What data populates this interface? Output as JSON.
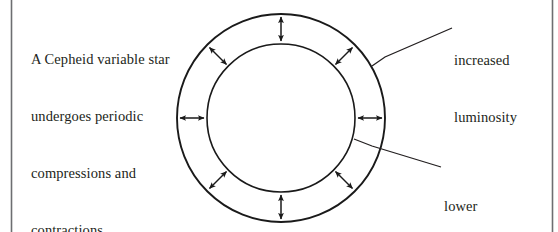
{
  "figure": {
    "caption": {
      "lines": [
        "A Cepheid variable star",
        "undergoes periodic",
        "compressions and",
        "contractions."
      ]
    },
    "labels": {
      "increased": {
        "lines": [
          "increased",
          "luminosity"
        ]
      },
      "lower": {
        "lines": [
          "lower",
          "luminosity"
        ]
      }
    },
    "colors": {
      "ink": "#231f20",
      "stroke": "#1a1a1a",
      "rule": "#6d6e71",
      "background": "#ffffff"
    },
    "geometry": {
      "center_x": 281,
      "center_y": 118,
      "outer_radius": 104,
      "inner_radius": 74,
      "arrow_count": 8,
      "arrow_angles_deg": [
        0,
        45,
        90,
        135,
        180,
        225,
        270,
        315
      ]
    },
    "rules": {
      "left_x": 11,
      "right_x": 552
    }
  }
}
